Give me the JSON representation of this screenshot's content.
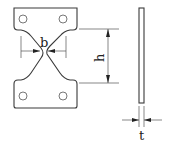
{
  "diagram": {
    "title": "",
    "front_view": {
      "name": "X-shaped steel plate (front view)",
      "holes_per_plate": 2,
      "dimensions": {
        "width_label": "b",
        "height_label": "h"
      }
    },
    "side_view": {
      "name": "plate side view",
      "dimensions": {
        "thickness_label": "t"
      }
    },
    "colors": {
      "stroke": "#3a3a3a",
      "background": "#ffffff"
    }
  }
}
